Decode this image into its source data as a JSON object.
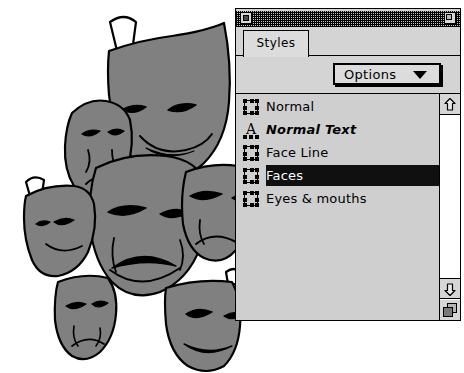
{
  "window": {
    "title_bar": {
      "close_box": "close-box",
      "zoom_box": "zoom-box",
      "pattern": "striped"
    },
    "tabs": [
      {
        "label": "Styles",
        "active": true
      }
    ],
    "toolbar": {
      "options_label": "Options",
      "options_caret": "chevron-down-icon"
    },
    "styles_list": {
      "items": [
        {
          "label": "Normal",
          "icon": "object-handles-icon",
          "selected": false,
          "italic": false
        },
        {
          "label": "Normal Text",
          "icon": "text-style-a-icon",
          "selected": false,
          "italic": true
        },
        {
          "label": "Face Line",
          "icon": "object-handles-icon",
          "selected": false,
          "italic": false
        },
        {
          "label": "Faces",
          "icon": "object-handles-icon",
          "selected": true,
          "italic": false
        },
        {
          "label": "Eyes & mouths",
          "icon": "object-handles-icon",
          "selected": false,
          "italic": false
        }
      ]
    },
    "scrollbar": {
      "up_arrow": "arrow-up-icon",
      "down_arrow": "arrow-down-icon",
      "grow_box": "resize-grow-icon"
    }
  },
  "artwork": {
    "title": "theatrical-masks-cluster",
    "description": "Cluster of overlapping comedy and tragedy theater masks",
    "fill_color": "#808080",
    "outline_color": "#000000"
  },
  "colors": {
    "window_background": "#d4d4d4",
    "list_background": "#cfcfcf",
    "selection_background": "#101010",
    "selection_text": "#ffffff",
    "scroll_track": "#ffffff",
    "outline": "#000000"
  }
}
